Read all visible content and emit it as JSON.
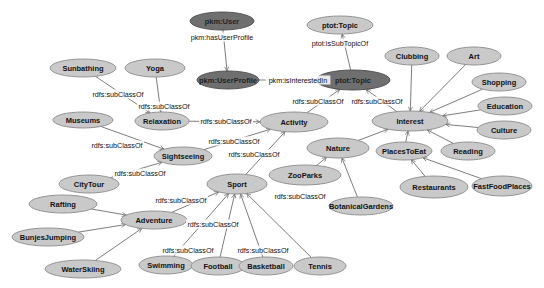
{
  "diagram": {
    "type": "ontology-graph",
    "colors": {
      "light_node_fill": "#c9c9c9",
      "light_node_stroke": "#8a8a8a",
      "dark_node_fill": "#6f6f6f",
      "dark_node_stroke": "#4a4a4a",
      "edge": "#6e6e6e",
      "background": "#ffffff"
    },
    "nodes": [
      {
        "id": "user",
        "label": "pkm:User",
        "x": 222,
        "y": 21,
        "w": 64,
        "h": 18,
        "style": "dark"
      },
      {
        "id": "userprofile",
        "label": "pkm:UserProfile",
        "x": 228,
        "y": 80,
        "w": 62,
        "h": 18,
        "style": "dark"
      },
      {
        "id": "topic_top",
        "label": "ptot:Topic",
        "x": 340,
        "y": 25,
        "w": 66,
        "h": 18,
        "style": "light"
      },
      {
        "id": "topic_mid",
        "label": "ptot:Topic",
        "x": 353,
        "y": 80,
        "w": 74,
        "h": 20,
        "style": "dark"
      },
      {
        "id": "sunbathing",
        "label": "Sunbathing",
        "x": 83,
        "y": 68,
        "w": 66,
        "h": 18,
        "style": "light"
      },
      {
        "id": "yoga",
        "label": "Yoga",
        "x": 155,
        "y": 68,
        "w": 60,
        "h": 18,
        "style": "light"
      },
      {
        "id": "relaxation",
        "label": "Relaxation",
        "x": 162,
        "y": 121,
        "w": 54,
        "h": 18,
        "style": "light"
      },
      {
        "id": "museums",
        "label": "Museums",
        "x": 83,
        "y": 120,
        "w": 60,
        "h": 16,
        "style": "light"
      },
      {
        "id": "sightseeing",
        "label": "Sightseeing",
        "x": 183,
        "y": 156,
        "w": 58,
        "h": 18,
        "style": "light"
      },
      {
        "id": "activity",
        "label": "Activity",
        "x": 294,
        "y": 122,
        "w": 68,
        "h": 20,
        "style": "light"
      },
      {
        "id": "interest",
        "label": "Interest",
        "x": 410,
        "y": 121,
        "w": 76,
        "h": 20,
        "style": "light"
      },
      {
        "id": "clubbing",
        "label": "Clubbing",
        "x": 412,
        "y": 56,
        "w": 54,
        "h": 18,
        "style": "light"
      },
      {
        "id": "art",
        "label": "Art",
        "x": 474,
        "y": 56,
        "w": 54,
        "h": 18,
        "style": "light"
      },
      {
        "id": "shopping",
        "label": "Shopping",
        "x": 499,
        "y": 82,
        "w": 54,
        "h": 18,
        "style": "light"
      },
      {
        "id": "education",
        "label": "Education",
        "x": 505,
        "y": 106,
        "w": 54,
        "h": 18,
        "style": "light"
      },
      {
        "id": "culture",
        "label": "Culture",
        "x": 504,
        "y": 130,
        "w": 54,
        "h": 18,
        "style": "light"
      },
      {
        "id": "reading",
        "label": "Reading",
        "x": 468,
        "y": 151,
        "w": 54,
        "h": 18,
        "style": "light"
      },
      {
        "id": "placestoeat",
        "label": "PlacesToEat",
        "x": 404,
        "y": 151,
        "w": 56,
        "h": 18,
        "style": "light"
      },
      {
        "id": "nature",
        "label": "Nature",
        "x": 338,
        "y": 148,
        "w": 62,
        "h": 20,
        "style": "light"
      },
      {
        "id": "zooparks",
        "label": "ZooParks",
        "x": 305,
        "y": 175,
        "w": 72,
        "h": 20,
        "style": "light"
      },
      {
        "id": "botanicalgardens",
        "label": "BotanicalGardens",
        "x": 361,
        "y": 206,
        "w": 64,
        "h": 18,
        "style": "light"
      },
      {
        "id": "restaurants",
        "label": "Restaurants",
        "x": 434,
        "y": 187,
        "w": 68,
        "h": 22,
        "style": "light"
      },
      {
        "id": "fastfoodplaces",
        "label": "FastFoodPlaces",
        "x": 502,
        "y": 186,
        "w": 60,
        "h": 20,
        "style": "light"
      },
      {
        "id": "citytour",
        "label": "CityTour",
        "x": 89,
        "y": 184,
        "w": 60,
        "h": 18,
        "style": "light"
      },
      {
        "id": "sport",
        "label": "Sport",
        "x": 237,
        "y": 184,
        "w": 60,
        "h": 20,
        "style": "light"
      },
      {
        "id": "rafting",
        "label": "Rafting",
        "x": 63,
        "y": 204,
        "w": 68,
        "h": 18,
        "style": "light"
      },
      {
        "id": "adventure",
        "label": "Adventure",
        "x": 154,
        "y": 220,
        "w": 66,
        "h": 18,
        "style": "light"
      },
      {
        "id": "bunjesjumping",
        "label": "BunjesJumping",
        "x": 48,
        "y": 237,
        "w": 72,
        "h": 18,
        "style": "light"
      },
      {
        "id": "waterskiing",
        "label": "WaterSkiing",
        "x": 83,
        "y": 269,
        "w": 76,
        "h": 18,
        "style": "light"
      },
      {
        "id": "swimming",
        "label": "Swimming",
        "x": 166,
        "y": 265,
        "w": 54,
        "h": 18,
        "style": "light"
      },
      {
        "id": "football",
        "label": "Football",
        "x": 218,
        "y": 266,
        "w": 54,
        "h": 18,
        "style": "light"
      },
      {
        "id": "basketball",
        "label": "Basketball",
        "x": 266,
        "y": 266,
        "w": 54,
        "h": 18,
        "style": "light"
      },
      {
        "id": "tennis",
        "label": "Tennis",
        "x": 320,
        "y": 266,
        "w": 52,
        "h": 18,
        "style": "light"
      }
    ],
    "edges": [
      {
        "from": "user",
        "to": "userprofile",
        "label": "pkm:hasUserProfile",
        "lx": 222,
        "ly": 37
      },
      {
        "from": "userprofile",
        "to": "topic_mid",
        "label": "pkm:isInterestedIn",
        "lx": 298,
        "ly": 80
      },
      {
        "from": "topic_mid",
        "to": "topic_top",
        "label": "ptot:isSubTopicOf",
        "lx": 340,
        "ly": 43
      },
      {
        "from": "activity",
        "to": "topic_mid",
        "label": "rdfs:subClassOf",
        "lx": 318,
        "ly": 101
      },
      {
        "from": "interest",
        "to": "topic_mid",
        "label": "rdfs:subClassOf",
        "lx": 377,
        "ly": 101
      },
      {
        "from": "sunbathing",
        "to": "relaxation",
        "label": "rdfs:subClassOf",
        "lx": 118,
        "ly": 94
      },
      {
        "from": "yoga",
        "to": "relaxation",
        "label": "rdfs:subClassOf",
        "lx": 164,
        "ly": 106
      },
      {
        "from": "relaxation",
        "to": "activity",
        "label": "rdfs:subClassOf",
        "lx": 226,
        "ly": 121
      },
      {
        "from": "museums",
        "to": "sightseeing",
        "label": "rdfs:subClassOf",
        "lx": 117,
        "ly": 145
      },
      {
        "from": "sightseeing",
        "to": "activity",
        "label": "rdfs:subClassOf",
        "lx": 234,
        "ly": 141
      },
      {
        "from": "sport",
        "to": "activity",
        "label": "rdfs:subClassOf",
        "lx": 254,
        "ly": 154
      },
      {
        "from": "nature",
        "to": "interest",
        "label": "",
        "lx": 0,
        "ly": 0
      },
      {
        "from": "zooparks",
        "to": "nature",
        "label": "",
        "lx": 0,
        "ly": 0
      },
      {
        "from": "botanicalgardens",
        "to": "nature",
        "label": "",
        "lx": 0,
        "ly": 0
      },
      {
        "from": "clubbing",
        "to": "interest",
        "label": "",
        "lx": 0,
        "ly": 0
      },
      {
        "from": "art",
        "to": "interest",
        "label": "",
        "lx": 0,
        "ly": 0
      },
      {
        "from": "shopping",
        "to": "interest",
        "label": "",
        "lx": 0,
        "ly": 0
      },
      {
        "from": "education",
        "to": "interest",
        "label": "",
        "lx": 0,
        "ly": 0
      },
      {
        "from": "culture",
        "to": "interest",
        "label": "",
        "lx": 0,
        "ly": 0
      },
      {
        "from": "reading",
        "to": "interest",
        "label": "",
        "lx": 0,
        "ly": 0
      },
      {
        "from": "placestoeat",
        "to": "interest",
        "label": "",
        "lx": 0,
        "ly": 0
      },
      {
        "from": "restaurants",
        "to": "placestoeat",
        "label": "",
        "lx": 0,
        "ly": 0
      },
      {
        "from": "fastfoodplaces",
        "to": "placestoeat",
        "label": "",
        "lx": 0,
        "ly": 0
      },
      {
        "from": "citytour",
        "to": "sightseeing",
        "label": "rdfs:subClassOf",
        "lx": 140,
        "ly": 173
      },
      {
        "from": "adventure",
        "to": "sport",
        "label": "rdfs:subClassOf",
        "lx": 181,
        "ly": 200
      },
      {
        "from": "rafting",
        "to": "adventure",
        "label": "",
        "lx": 0,
        "ly": 0
      },
      {
        "from": "bunjesjumping",
        "to": "adventure",
        "label": "",
        "lx": 0,
        "ly": 0
      },
      {
        "from": "waterskiing",
        "to": "adventure",
        "label": "",
        "lx": 0,
        "ly": 0
      },
      {
        "from": "swimming",
        "to": "sport",
        "label": "rdfs:subClassOf",
        "lx": 188,
        "ly": 250
      },
      {
        "from": "football",
        "to": "sport",
        "label": "rdfs:subClassOf",
        "lx": 213,
        "ly": 224
      },
      {
        "from": "basketball",
        "to": "sport",
        "label": "rdfs:subClassOf",
        "lx": 263,
        "ly": 250
      },
      {
        "from": "tennis",
        "to": "sport",
        "label": "rdfs:subClassOf",
        "lx": 300,
        "ly": 196
      }
    ]
  }
}
